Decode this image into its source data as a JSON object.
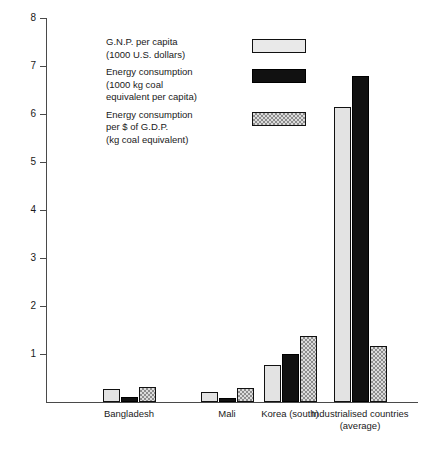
{
  "chart_data": {
    "type": "bar",
    "title": "",
    "subtitle": "",
    "xlabel": "",
    "ylabel": "",
    "ylim": [
      0,
      8
    ],
    "yticks": [
      1,
      2,
      3,
      4,
      5,
      6,
      7,
      8
    ],
    "ytick_labels": [
      "1",
      "2",
      "3",
      "4",
      "5",
      "6",
      "7",
      "8"
    ],
    "grid": false,
    "legend_position": "upper-left-inset",
    "categories": [
      "Bangladesh",
      "Mali",
      "Korea (south)",
      "Industrialised countries (average)"
    ],
    "series": [
      {
        "name": "G.N.P. per capita (1000 U.S. dollars)",
        "legend_lines": [
          "G.N.P. per capita",
          "(1000 U.S. dollars)"
        ],
        "swatch": "light-grey",
        "values": [
          0.27,
          0.2,
          0.78,
          6.15
        ]
      },
      {
        "name": "Energy consumption (1000 kg coal equivalent per capita)",
        "legend_lines": [
          "Energy consumption",
          "(1000 kg coal",
          "equivalent per capita)"
        ],
        "swatch": "black",
        "values": [
          0.1,
          0.08,
          1.0,
          6.8
        ]
      },
      {
        "name": "Energy consumption per $ of G.D.P. (kg coal equivalent)",
        "legend_lines": [
          "Energy consumption",
          "per $ of G.D.P.",
          "(kg coal equivalent)"
        ],
        "swatch": "checkered-grey",
        "values": [
          0.32,
          0.3,
          1.38,
          1.17
        ]
      }
    ]
  },
  "colors": {
    "series_light": "#e3e3e3",
    "series_black": "#111111",
    "series_checker": "#dcdcdc",
    "axis": "#4a4a4a",
    "text": "#1a1a1a",
    "background": "#ffffff"
  }
}
